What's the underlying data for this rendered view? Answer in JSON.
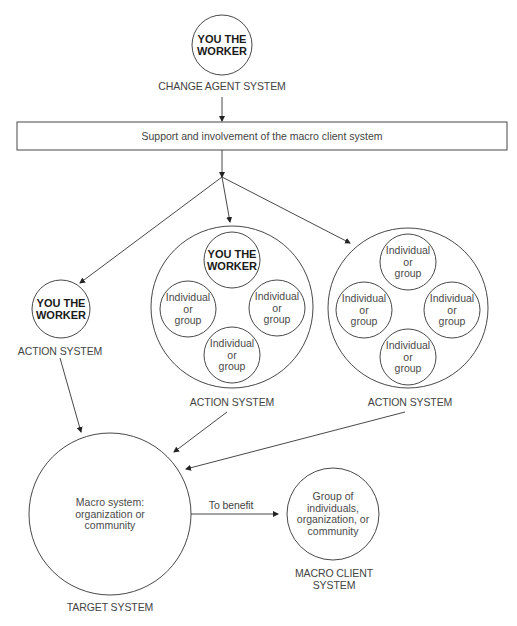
{
  "diagram": {
    "change_agent": {
      "circle_text": [
        "YOU THE",
        "WORKER"
      ],
      "label": "CHANGE AGENT SYSTEM"
    },
    "support_box": {
      "text": "Support and involvement of the macro client system"
    },
    "action_systems": [
      {
        "label": "ACTION SYSTEM",
        "members": [
          {
            "lines": [
              "YOU THE",
              "WORKER"
            ],
            "bold": true
          }
        ]
      },
      {
        "label": "ACTION SYSTEM",
        "members": [
          {
            "lines": [
              "YOU THE",
              "WORKER"
            ],
            "bold": true
          },
          {
            "lines": [
              "Individual",
              "or",
              "group"
            ]
          },
          {
            "lines": [
              "Individual",
              "or",
              "group"
            ]
          },
          {
            "lines": [
              "Individual",
              "or",
              "group"
            ]
          }
        ]
      },
      {
        "label": "ACTION SYSTEM",
        "members": [
          {
            "lines": [
              "Individual",
              "or",
              "group"
            ]
          },
          {
            "lines": [
              "Individual",
              "or",
              "group"
            ]
          },
          {
            "lines": [
              "Individual",
              "or",
              "group"
            ]
          },
          {
            "lines": [
              "Individual",
              "or",
              "group"
            ]
          }
        ]
      }
    ],
    "target_system": {
      "circle_text": [
        "Macro system:",
        "organization or",
        "community"
      ],
      "label": "TARGET SYSTEM"
    },
    "benefit_arrow": {
      "label": "To benefit"
    },
    "macro_client_system": {
      "circle_text": [
        "Group of",
        "individuals,",
        "organization, or",
        "community"
      ],
      "label": [
        "MACRO CLIENT",
        "SYSTEM"
      ]
    }
  }
}
